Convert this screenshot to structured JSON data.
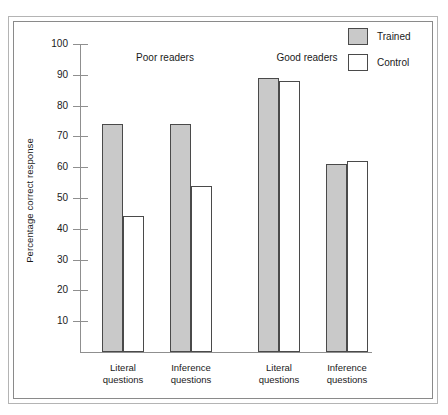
{
  "chart_data": {
    "type": "bar",
    "title": "",
    "xlabel": "",
    "ylabel": "Percentage correct response",
    "ylim": [
      0,
      100
    ],
    "ytick_step": 10,
    "yticks": [
      100,
      90,
      80,
      70,
      60,
      50,
      40,
      30,
      20,
      10
    ],
    "grid": false,
    "legend_position": "top-right",
    "legend": [
      "Trained",
      "Control"
    ],
    "group_labels": [
      "Poor readers",
      "Good readers"
    ],
    "categories": [
      "Literal questions",
      "Inference questions",
      "Literal questions",
      "Inference questions"
    ],
    "category_lines": [
      [
        "Literal",
        "questions"
      ],
      [
        "Inference",
        "questions"
      ],
      [
        "Literal",
        "questions"
      ],
      [
        "Inference",
        "questions"
      ]
    ],
    "series": [
      {
        "name": "Trained",
        "color": "#c9c9c9",
        "values": [
          74,
          74,
          89,
          61
        ]
      },
      {
        "name": "Control",
        "color": "#ffffff",
        "values": [
          44,
          54,
          88,
          62
        ]
      }
    ]
  },
  "colors": {
    "trained_fill": "#c9c9c9",
    "control_fill": "#ffffff",
    "bar_outline": "#4a4a4a",
    "axis": "#8f8f8f",
    "frame_outer": "#b4b4b4",
    "frame_inner": "#8a8a8a",
    "text": "#1a1a1a"
  }
}
